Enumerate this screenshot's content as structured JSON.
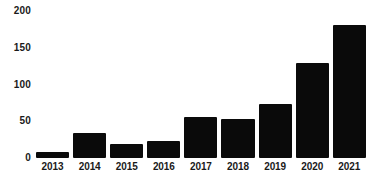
{
  "chart_data": {
    "type": "bar",
    "title": "",
    "subtitle": "",
    "xlabel": "",
    "ylabel": "",
    "categories": [
      "2013",
      "2014",
      "2015",
      "2016",
      "2017",
      "2018",
      "2019",
      "2020",
      "2021"
    ],
    "values": [
      8,
      34,
      19,
      23,
      56,
      53,
      73,
      129,
      181
    ],
    "ylim": [
      0,
      200
    ],
    "y_ticks": [
      "0",
      "50",
      "100",
      "150",
      "200"
    ],
    "y_tick_values": [
      0,
      50,
      100,
      150,
      200
    ],
    "grid": false,
    "legend": null,
    "bar_color": "#0a0a0a",
    "background_color": "#ffffff",
    "text_color": "#1a1a1a"
  }
}
